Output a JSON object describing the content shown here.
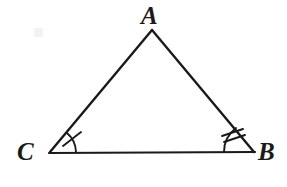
{
  "figure": {
    "kind": "geometry-diagram",
    "shape": "triangle",
    "background_color": "#ffffff",
    "stroke_color": "#1a1a1a",
    "stroke_width": 2,
    "canvas": {
      "width": 287,
      "height": 187
    },
    "vertices": [
      {
        "id": "A",
        "label": "A",
        "x": 152,
        "y": 30,
        "label_x": 141,
        "label_y": 3
      },
      {
        "id": "C",
        "label": "C",
        "x": 50,
        "y": 152,
        "label_x": 17,
        "label_y": 139
      },
      {
        "id": "B",
        "label": "B",
        "x": 254,
        "y": 152,
        "label_x": 258,
        "label_y": 139
      }
    ],
    "sides": [
      {
        "id": "CA",
        "from": "C",
        "to": "A"
      },
      {
        "id": "AB",
        "from": "A",
        "to": "B"
      },
      {
        "id": "CB",
        "from": "C",
        "to": "B"
      }
    ],
    "angle_marks": [
      {
        "id": "angle-C",
        "at_vertex": "C",
        "tick_count": 1,
        "arc_radius": 26,
        "note": "single tick mark across arc"
      },
      {
        "id": "angle-B",
        "at_vertex": "B",
        "tick_count": 2,
        "arc_radius": 30,
        "note": "double tick marks across arc"
      }
    ],
    "artifacts": [
      {
        "id": "scan-smudge",
        "x": 34,
        "y": 28,
        "color": "#f2f2f2"
      }
    ]
  }
}
